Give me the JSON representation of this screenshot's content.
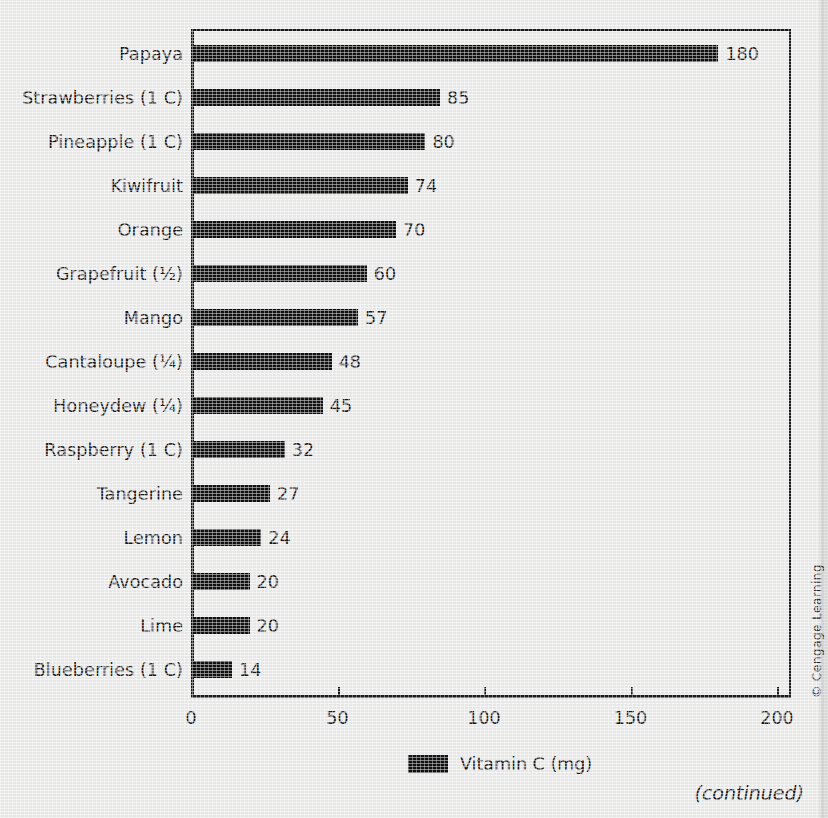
{
  "figure": {
    "credit": "© Cengage Learning",
    "continued_note": "(continued)"
  },
  "legend": {
    "label": "Vitamin C (mg)",
    "swatch_color": "#111111"
  },
  "axis": {
    "x_tick_labels": [
      "0",
      "50",
      "100",
      "150",
      "200"
    ],
    "x_ticks": [
      0,
      50,
      100,
      150,
      200
    ]
  },
  "chart_data": {
    "type": "bar",
    "orientation": "horizontal",
    "title": "",
    "subtitle": "",
    "xlabel": "Vitamin C (mg)",
    "ylabel": "",
    "xlim": [
      0,
      200
    ],
    "xticks": [
      0,
      50,
      100,
      150,
      200
    ],
    "grid": false,
    "legend": [
      "Vitamin C (mg)"
    ],
    "legend_position": "bottom-center",
    "bar_color": "#111111",
    "value_labels": true,
    "categories": [
      "Papaya",
      "Strawberries (1 C)",
      "Pineapple (1 C)",
      "Kiwifruit",
      "Orange",
      "Grapefruit (½)",
      "Mango",
      "Cantaloupe (¼)",
      "Honeydew (¼)",
      "Raspberry (1 C)",
      "Tangerine",
      "Lemon",
      "Avocado",
      "Lime",
      "Blueberries (1 C)"
    ],
    "values": [
      180,
      85,
      80,
      74,
      70,
      60,
      57,
      48,
      45,
      32,
      27,
      24,
      20,
      20,
      14
    ],
    "value_text": [
      "180",
      "85",
      "80",
      "74",
      "70",
      "60",
      "57",
      "48",
      "45",
      "32",
      "27",
      "24",
      "20",
      "20",
      "14"
    ],
    "annotations": [
      "© Cengage Learning",
      "(continued)"
    ]
  }
}
